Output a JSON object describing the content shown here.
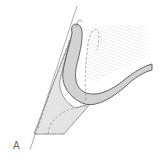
{
  "figure": {
    "labels": {
      "a": "A"
    },
    "colors": {
      "band_fill": "#d2d2d2",
      "band_stroke": "#555555",
      "hatch": "#e4e4e4",
      "lower_region": "#e2e2e2",
      "lower_stroke": "#777777",
      "guide_line": "#999999",
      "dashed": "#8a8a8a"
    }
  }
}
